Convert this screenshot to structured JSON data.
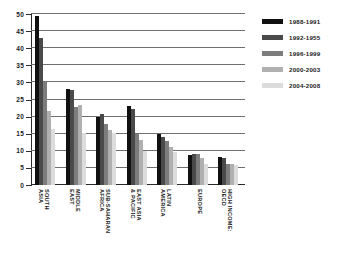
{
  "chart_data": {
    "type": "bar",
    "title": "",
    "subtitle": "",
    "xlabel": "",
    "ylabel": "",
    "ylim": [
      0,
      50
    ],
    "yticks": [
      0,
      5,
      10,
      15,
      20,
      25,
      30,
      35,
      40,
      45,
      50
    ],
    "grid": true,
    "legend_position": "right",
    "categories": [
      "SOUTH\nASIA",
      "MIDDLE\nEAST",
      "SUB-SAHARAN\nAFRICA",
      "EAST ASIA\n& PACIFIC",
      "LATIN\nAMERICA",
      "EUROPE",
      "HIGH INCOME:\nOECD"
    ],
    "series": [
      {
        "name": "1988-1991",
        "color": "#111111",
        "values": [
          49.5,
          28.0,
          20.0,
          23.0,
          15.0,
          8.8,
          8.3
        ]
      },
      {
        "name": "1992-1955",
        "color": "#4a4a4a",
        "values": [
          43.0,
          27.8,
          20.8,
          22.2,
          14.0,
          9.2,
          7.8
        ]
      },
      {
        "name": "1996-1999",
        "color": "#7d7d7d",
        "values": [
          30.2,
          22.8,
          17.8,
          14.8,
          12.8,
          9.0,
          6.2
        ]
      },
      {
        "name": "2000-2003",
        "color": "#b0b0b0",
        "values": [
          21.5,
          23.5,
          16.0,
          13.2,
          11.0,
          7.8,
          6.0
        ]
      },
      {
        "name": "2004-2008",
        "color": "#dcdcdc",
        "values": [
          16.3,
          15.2,
          15.3,
          9.8,
          9.7,
          6.2,
          5.8
        ]
      }
    ]
  },
  "legend": {
    "items": [
      {
        "label": "1988-1991"
      },
      {
        "label": "1992-1955"
      },
      {
        "label": "1996-1999"
      },
      {
        "label": "2000-2003"
      },
      {
        "label": "2004-2008"
      }
    ]
  }
}
